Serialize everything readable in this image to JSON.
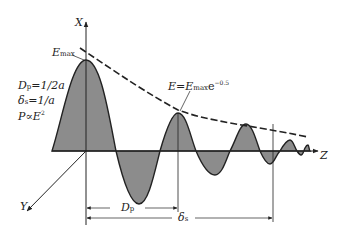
{
  "diagram": {
    "type": "electromagnetic wave skin depth diagram",
    "axes": {
      "x_label": "X",
      "y_label": "Y",
      "z_label": "Z"
    },
    "labels": {
      "emax": {
        "main": "E",
        "sub": "max"
      },
      "envelope": {
        "lhs": "E",
        "eq": "=",
        "rhs": "E",
        "sub": "max",
        "e": "e",
        "exp": "−0.5"
      },
      "formulas": [
        {
          "lhs": "D",
          "sub": "p",
          "rhs": "=1/2a"
        },
        {
          "lhs": "δ",
          "sub": "s",
          "rhs": "=1/a"
        },
        {
          "lhs": "P∝E",
          "sup": "2"
        }
      ],
      "dp_dim": {
        "main": "D",
        "sub": "p"
      },
      "ds_dim": {
        "main": "δ",
        "sub": "s"
      }
    },
    "colors": {
      "fill": "#8c8c8c",
      "stroke": "#222222",
      "background": "#ffffff"
    }
  }
}
